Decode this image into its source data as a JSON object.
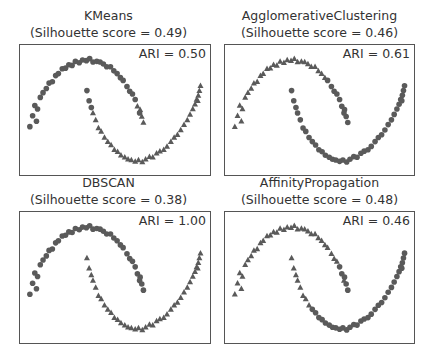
{
  "chart_data": {
    "type": "scatter",
    "colors": {
      "marker": "#5a5a5a",
      "frame": "#555555",
      "text": "#333333"
    },
    "xlim": [
      -1.25,
      2.25
    ],
    "ylim": [
      -0.72,
      1.22
    ],
    "points": {
      "x": [
        -1.07,
        -1.02,
        -0.98,
        -0.93,
        -0.88,
        -0.95,
        -0.83,
        -0.77,
        -0.72,
        -0.66,
        -0.6,
        -0.55,
        -0.48,
        -0.42,
        -0.36,
        -0.3,
        -0.24,
        -0.17,
        -0.11,
        -0.04,
        0.02,
        0.08,
        0.15,
        0.21,
        0.27,
        0.33,
        0.4,
        0.46,
        0.52,
        0.58,
        0.63,
        0.7,
        0.75,
        0.8,
        0.85,
        0.89,
        0.94,
        0.97,
        1.0,
        0.93,
        -0.03,
        0.01,
        0.05,
        0.08,
        0.13,
        0.18,
        0.23,
        0.29,
        0.35,
        0.41,
        0.47,
        0.53,
        0.59,
        0.66,
        0.72,
        0.78,
        0.85,
        0.91,
        0.98,
        1.04,
        1.11,
        1.17,
        1.24,
        1.3,
        1.37,
        1.43,
        1.5,
        1.56,
        1.62,
        1.68,
        1.74,
        1.8,
        1.85,
        1.9,
        1.94,
        1.97,
        2.0,
        2.02,
        2.04,
        1.99
      ],
      "y": [
        0.02,
        0.18,
        0.33,
        0.28,
        0.45,
        0.1,
        0.52,
        0.58,
        0.66,
        0.68,
        0.77,
        0.8,
        0.87,
        0.88,
        0.93,
        0.92,
        0.98,
        0.96,
        1.0,
        0.99,
        1.02,
        0.97,
        0.98,
        0.97,
        0.94,
        0.9,
        0.9,
        0.84,
        0.8,
        0.74,
        0.7,
        0.61,
        0.54,
        0.5,
        0.42,
        0.32,
        0.27,
        0.17,
        0.08,
        0.22,
        0.55,
        0.4,
        0.3,
        0.22,
        0.12,
        0.0,
        -0.05,
        -0.14,
        -0.2,
        -0.25,
        -0.32,
        -0.35,
        -0.4,
        -0.43,
        -0.46,
        -0.47,
        -0.49,
        -0.47,
        -0.5,
        -0.46,
        -0.42,
        -0.43,
        -0.37,
        -0.34,
        -0.32,
        -0.27,
        -0.2,
        -0.14,
        -0.1,
        -0.03,
        0.05,
        0.12,
        0.2,
        0.28,
        0.35,
        0.42,
        0.48,
        0.55,
        0.62,
        0.4
      ]
    },
    "panels": [
      {
        "title": "KMeans",
        "subtitle": "(Silhouette score = 0.49)",
        "annotation": "ARI = 0.50",
        "labels": [
          0,
          0,
          0,
          0,
          0,
          0,
          0,
          0,
          0,
          0,
          0,
          0,
          0,
          0,
          0,
          0,
          0,
          0,
          0,
          0,
          0,
          0,
          0,
          0,
          0,
          0,
          0,
          0,
          0,
          0,
          0,
          0,
          0,
          0,
          0,
          1,
          1,
          1,
          1,
          0,
          0,
          0,
          0,
          1,
          1,
          1,
          1,
          1,
          1,
          1,
          1,
          1,
          1,
          1,
          1,
          1,
          1,
          1,
          1,
          1,
          1,
          1,
          1,
          1,
          1,
          1,
          1,
          1,
          1,
          1,
          1,
          1,
          1,
          1,
          1,
          1,
          1,
          1,
          1,
          1
        ]
      },
      {
        "title": "AgglomerativeClustering",
        "subtitle": "(Silhouette score = 0.46)",
        "annotation": "ARI = 0.61",
        "labels": [
          1,
          1,
          1,
          1,
          1,
          1,
          1,
          1,
          1,
          1,
          1,
          1,
          1,
          1,
          1,
          1,
          1,
          1,
          1,
          1,
          1,
          1,
          1,
          1,
          1,
          1,
          1,
          1,
          1,
          1,
          0,
          0,
          0,
          0,
          0,
          0,
          0,
          0,
          0,
          0,
          0,
          0,
          0,
          0,
          0,
          0,
          0,
          0,
          0,
          0,
          0,
          0,
          0,
          0,
          0,
          0,
          0,
          0,
          0,
          0,
          0,
          0,
          0,
          0,
          0,
          0,
          0,
          0,
          0,
          0,
          0,
          0,
          0,
          0,
          0,
          0,
          0,
          0,
          0,
          0
        ]
      },
      {
        "title": "DBSCAN",
        "subtitle": "(Silhouette score = 0.38)",
        "annotation": "ARI = 1.00",
        "labels": [
          0,
          0,
          0,
          0,
          0,
          0,
          0,
          0,
          0,
          0,
          0,
          0,
          0,
          0,
          0,
          0,
          0,
          0,
          0,
          0,
          0,
          0,
          0,
          0,
          0,
          0,
          0,
          0,
          0,
          0,
          0,
          0,
          0,
          0,
          0,
          0,
          0,
          0,
          0,
          0,
          1,
          1,
          1,
          1,
          1,
          1,
          1,
          1,
          1,
          1,
          1,
          1,
          1,
          1,
          1,
          1,
          1,
          1,
          1,
          1,
          1,
          1,
          1,
          1,
          1,
          1,
          1,
          1,
          1,
          1,
          1,
          1,
          1,
          1,
          1,
          1,
          1,
          1,
          1,
          1
        ]
      },
      {
        "title": "AffinityPropagation",
        "subtitle": "(Silhouette score = 0.48)",
        "annotation": "ARI = 0.46",
        "labels": [
          1,
          1,
          1,
          1,
          1,
          1,
          1,
          1,
          1,
          1,
          1,
          1,
          1,
          1,
          1,
          1,
          1,
          1,
          1,
          1,
          1,
          1,
          1,
          1,
          1,
          1,
          1,
          1,
          1,
          1,
          1,
          1,
          1,
          1,
          0,
          0,
          0,
          0,
          0,
          1,
          1,
          1,
          1,
          1,
          1,
          1,
          1,
          1,
          0,
          0,
          0,
          0,
          0,
          0,
          0,
          0,
          0,
          0,
          0,
          0,
          0,
          0,
          0,
          0,
          0,
          0,
          0,
          0,
          0,
          0,
          0,
          0,
          0,
          0,
          0,
          0,
          0,
          0,
          0,
          0
        ]
      }
    ],
    "legend": "none",
    "grid": false,
    "axes_ticks": false
  }
}
